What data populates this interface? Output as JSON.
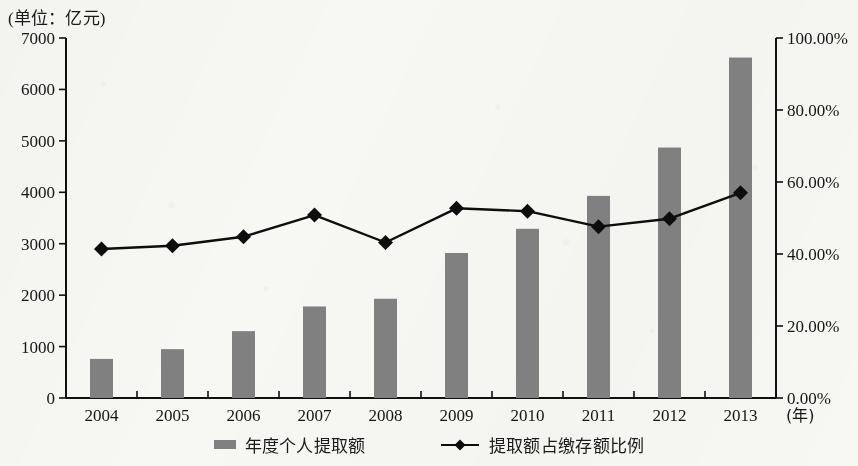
{
  "unit_note": "(单位：亿元)",
  "chart_data": {
    "type": "bar",
    "title": "",
    "subtitle": "",
    "unit_note": "(单位：亿元)",
    "xlabel": "(年)",
    "ylabel": "",
    "y2label": "",
    "grid": false,
    "legend_position": "bottom",
    "categories": [
      "2004",
      "2005",
      "2006",
      "2007",
      "2008",
      "2009",
      "2010",
      "2011",
      "2012",
      "2013"
    ],
    "ylim": [
      0,
      7000
    ],
    "y_ticks": [
      "0",
      "1000",
      "2000",
      "3000",
      "4000",
      "5000",
      "6000",
      "7000"
    ],
    "y2lim": [
      0,
      100
    ],
    "y2_ticks": [
      "0.00%",
      "20.00%",
      "40.00%",
      "60.00%",
      "80.00%",
      "100.00%"
    ],
    "series": [
      {
        "name": "年度个人提取额",
        "type": "bar",
        "axis": "left",
        "unit": "亿元",
        "color": "#808080",
        "values": [
          760,
          950,
          1300,
          1780,
          1930,
          2820,
          3290,
          3930,
          4870,
          6620
        ]
      },
      {
        "name": "提取额占缴存额比例",
        "type": "line",
        "axis": "right",
        "unit": "%",
        "color": "#0d0d0d",
        "marker": "diamond",
        "values": [
          41.4,
          42.3,
          44.8,
          50.8,
          43.2,
          52.7,
          51.9,
          47.6,
          49.8,
          57.0
        ]
      }
    ]
  },
  "legend": [
    {
      "label": "年度个人提取额",
      "marker": "bar-swatch"
    },
    {
      "label": "提取额占缴存额比例",
      "marker": "line-diamond-swatch"
    }
  ],
  "axes": {
    "x_axis_unit_label": "(年)"
  },
  "colors": {
    "bar": "#808080",
    "line": "#0d0d0d",
    "axis": "#101010",
    "text": "#151515",
    "background": "#f7f7f4"
  }
}
